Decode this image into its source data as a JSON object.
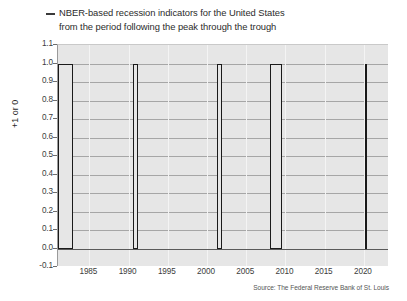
{
  "legend": {
    "marker": "line-dash-icon",
    "line1": "NBER-based recession indicators for the United States",
    "line2": "from the period following the peak through the trough"
  },
  "source": "Source: The Federal Reserve Bank of St. Louis",
  "axis_title_y": "+1 or 0",
  "colors": {
    "plot_background": "#e6e6e6",
    "grid_horizontal": "#a6a6a6",
    "grid_vertical": "#f4f4f4",
    "bar_outline": "#1a1a1a",
    "text": "#2b2b2b",
    "page_background": "#ffffff"
  },
  "chart_data": {
    "type": "bar",
    "title": "NBER-based recession indicators for the United States from the period following the peak through the trough",
    "subtitle": "",
    "xlabel": "",
    "ylabel": "+1 or 0",
    "xlim": [
      1981.0,
      2023.2
    ],
    "ylim": [
      -0.1,
      1.1
    ],
    "grid": true,
    "legend_position": "top-left",
    "yticks": [
      1.1,
      1.0,
      0.9,
      0.8,
      0.7,
      0.6,
      0.5,
      0.4,
      0.3,
      0.2,
      0.1,
      0.0,
      -0.1
    ],
    "ytick_labels": [
      "1.1",
      "1.0",
      "0.9",
      "0.8",
      "0.7",
      "0.6",
      "0.5",
      "0.4",
      "0.3",
      "0.2",
      "0.1",
      "0.0",
      "-0.1"
    ],
    "xticks": [
      1985,
      1990,
      1995,
      2000,
      2005,
      2010,
      2015,
      2020
    ],
    "xtick_labels": [
      "1985",
      "1990",
      "1995",
      "2000",
      "2005",
      "2010",
      "2015",
      "2020"
    ],
    "series": [
      {
        "name": "NBER recession indicator",
        "values": [
          1,
          1,
          1,
          1,
          1
        ],
        "bars": [
          {
            "label": "1981-07 to 1982-11",
            "start": 1981.0,
            "end": 1982.92,
            "value": 1
          },
          {
            "label": "1990-07 to 1991-03",
            "start": 1990.5,
            "end": 1991.25,
            "value": 1
          },
          {
            "label": "2001-03 to 2001-11",
            "start": 2001.25,
            "end": 2001.92,
            "value": 1
          },
          {
            "label": "2007-12 to 2009-06",
            "start": 2008.0,
            "end": 2009.5,
            "value": 1
          },
          {
            "label": "2020-02 to 2020-04",
            "start": 2020.17,
            "end": 2020.42,
            "value": 1
          }
        ]
      }
    ]
  }
}
